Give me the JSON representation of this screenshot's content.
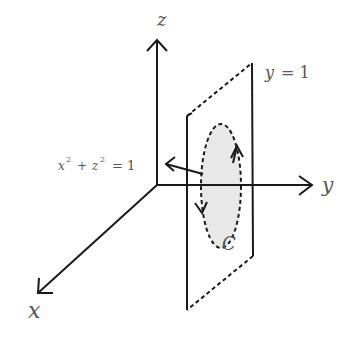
{
  "diagram": {
    "axes": {
      "x": {
        "label": "x"
      },
      "y": {
        "label": "y"
      },
      "z": {
        "label": "z"
      }
    },
    "plane": {
      "label_var": "y",
      "label_eq": "= 1"
    },
    "cylinder": {
      "label_x": "x",
      "label_sup1": "2",
      "label_plus": "+",
      "label_z": "z",
      "label_sup2": "2",
      "label_eq": "= 1"
    },
    "curve": {
      "label": "C",
      "orientation": "counterclockwise (up on right, down on left)"
    },
    "colors": {
      "line": "#1a1a1a",
      "label": "#555555",
      "fill": "#e8e8e8"
    }
  }
}
